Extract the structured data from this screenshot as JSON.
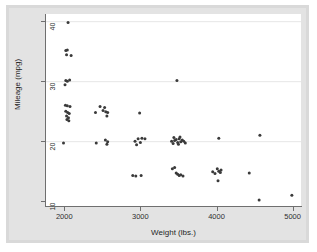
{
  "chart_data": {
    "type": "scatter",
    "title": "",
    "xlabel": "Weight (lbs.)",
    "ylabel": "Mileage (mpg)",
    "xlim": [
      1760,
      5110
    ],
    "ylim": [
      9.2,
      41.2
    ],
    "xticks": [
      2000,
      3000,
      4000,
      5000
    ],
    "yticks": [
      10,
      20,
      30,
      40
    ],
    "xtick_labels": [
      "2000",
      "3000",
      "4000",
      "5000"
    ],
    "ytick_labels": [
      "10",
      "20",
      "30",
      "40"
    ],
    "grid": "horizontal-only",
    "gridlines_y": [
      20,
      30,
      40
    ],
    "legend": "none",
    "marker": {
      "shape": "circle",
      "color": "#3a3a3a",
      "size_px": 3.0
    },
    "n_points": 74,
    "series": [
      {
        "name": "Automobiles",
        "x": [
          2930,
          3350,
          2640,
          3250,
          4080,
          3670,
          2230,
          3280,
          3880,
          3400,
          3330,
          3070,
          3620,
          3600,
          3740,
          4130,
          3720,
          3955,
          3830,
          2200,
          2150,
          2670,
          3700,
          3955,
          3830,
          4070,
          2020,
          2280,
          2750,
          3170,
          2370,
          2020,
          2130,
          2190,
          2690,
          2240,
          2460,
          3420,
          3195,
          3240,
          3260,
          4330,
          3900,
          4290,
          4720,
          3730,
          3200,
          4060,
          3830,
          2690,
          2830,
          3370,
          2290,
          3420,
          3880,
          3180,
          2200,
          2520,
          2300,
          2230,
          2750,
          2120,
          2650,
          1800,
          1760,
          2050,
          2410,
          2200,
          2670,
          2160,
          2370,
          2020,
          2280,
          3170
        ],
        "y": [
          22,
          17,
          22,
          20,
          15,
          18,
          26,
          20,
          16,
          19,
          19,
          19,
          17,
          16,
          14,
          14,
          21,
          14,
          14,
          30,
          29,
          18,
          18,
          14,
          14,
          12,
          30,
          24,
          24,
          18,
          29,
          32,
          34,
          35,
          28,
          25,
          21,
          22,
          18,
          18,
          20,
          14,
          16,
          12,
          10,
          16,
          22,
          15,
          15,
          17,
          23,
          19,
          26,
          20,
          16,
          19,
          28,
          24,
          28,
          28,
          22,
          35,
          22,
          40,
          39,
          34,
          25,
          31,
          24,
          30,
          26,
          29,
          28,
          19
        ]
      }
    ],
    "points": [
      {
        "x": 2050,
        "y": 39.8
      },
      {
        "x": 2040,
        "y": 35.2
      },
      {
        "x": 2030,
        "y": 34.4
      },
      {
        "x": 2090,
        "y": 34.3
      },
      {
        "x": 2010,
        "y": 29.4
      },
      {
        "x": 2020,
        "y": 30.1
      },
      {
        "x": 2040,
        "y": 30.0
      },
      {
        "x": 2070,
        "y": 30.2
      },
      {
        "x": 3480,
        "y": 30.1
      },
      {
        "x": 2015,
        "y": 26.0
      },
      {
        "x": 2040,
        "y": 25.9
      },
      {
        "x": 2075,
        "y": 25.8
      },
      {
        "x": 2020,
        "y": 25.0
      },
      {
        "x": 2045,
        "y": 24.8
      },
      {
        "x": 2065,
        "y": 24.6
      },
      {
        "x": 2030,
        "y": 24.2
      },
      {
        "x": 2055,
        "y": 23.9
      },
      {
        "x": 2035,
        "y": 23.6
      },
      {
        "x": 2060,
        "y": 23.4
      },
      {
        "x": 2410,
        "y": 24.8
      },
      {
        "x": 2470,
        "y": 25.8
      },
      {
        "x": 2530,
        "y": 25.6
      },
      {
        "x": 2545,
        "y": 24.9
      },
      {
        "x": 2570,
        "y": 24.8
      },
      {
        "x": 2560,
        "y": 24.2
      },
      {
        "x": 2990,
        "y": 24.7
      },
      {
        "x": 1990,
        "y": 19.7
      },
      {
        "x": 2420,
        "y": 19.7
      },
      {
        "x": 2540,
        "y": 20.2
      },
      {
        "x": 2560,
        "y": 19.5
      },
      {
        "x": 2570,
        "y": 19.9
      },
      {
        "x": 2930,
        "y": 20.0
      },
      {
        "x": 2950,
        "y": 19.4
      },
      {
        "x": 2970,
        "y": 20.4
      },
      {
        "x": 3000,
        "y": 19.8
      },
      {
        "x": 3020,
        "y": 20.5
      },
      {
        "x": 3060,
        "y": 20.4
      },
      {
        "x": 3410,
        "y": 20.0
      },
      {
        "x": 3430,
        "y": 19.6
      },
      {
        "x": 3450,
        "y": 20.1
      },
      {
        "x": 3470,
        "y": 20.3
      },
      {
        "x": 3490,
        "y": 19.8
      },
      {
        "x": 3510,
        "y": 20.4
      },
      {
        "x": 3530,
        "y": 19.9
      },
      {
        "x": 3550,
        "y": 20.2
      },
      {
        "x": 3570,
        "y": 20.0
      },
      {
        "x": 3590,
        "y": 19.7
      },
      {
        "x": 3520,
        "y": 20.7
      },
      {
        "x": 4030,
        "y": 20.5
      },
      {
        "x": 4570,
        "y": 21.0
      },
      {
        "x": 2900,
        "y": 14.3
      },
      {
        "x": 2940,
        "y": 14.2
      },
      {
        "x": 3010,
        "y": 14.3
      },
      {
        "x": 3420,
        "y": 15.4
      },
      {
        "x": 3450,
        "y": 15.6
      },
      {
        "x": 3470,
        "y": 14.7
      },
      {
        "x": 3490,
        "y": 14.5
      },
      {
        "x": 3510,
        "y": 14.3
      },
      {
        "x": 3530,
        "y": 14.4
      },
      {
        "x": 3560,
        "y": 14.2
      },
      {
        "x": 3950,
        "y": 14.9
      },
      {
        "x": 3980,
        "y": 14.6
      },
      {
        "x": 4010,
        "y": 15.4
      },
      {
        "x": 4030,
        "y": 15.0
      },
      {
        "x": 4050,
        "y": 14.8
      },
      {
        "x": 4060,
        "y": 15.2
      },
      {
        "x": 4020,
        "y": 13.4
      },
      {
        "x": 4430,
        "y": 14.7
      },
      {
        "x": 4560,
        "y": 10.2
      },
      {
        "x": 4990,
        "y": 11.0
      },
      {
        "x": 2020,
        "y": 35.1
      },
      {
        "x": 2510,
        "y": 25.1
      },
      {
        "x": 3440,
        "y": 20.6
      },
      {
        "x": 3500,
        "y": 19.5
      }
    ]
  },
  "axes": {
    "x_title": "Weight (lbs.)",
    "y_title": "Mileage (mpg)"
  }
}
